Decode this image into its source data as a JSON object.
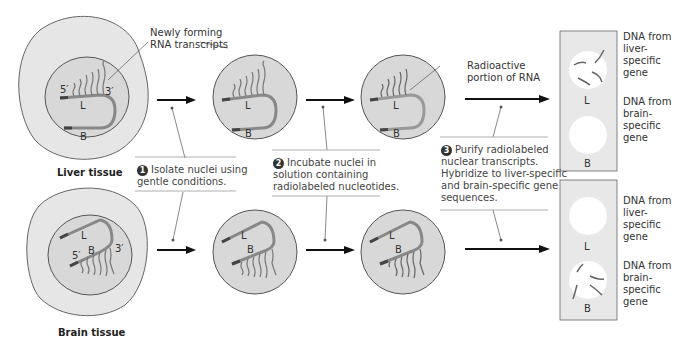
{
  "labels": {
    "newly_forming": "Newly forming RNA transcripts",
    "newly_forming_l1": "Newly forming",
    "newly_forming_l2": "RNA transcripts",
    "radioactive_l1": "Radioactive",
    "radioactive_l2": "portion of RNA",
    "liver_tissue": "Liver tissue",
    "brain_tissue": "Brain tissue",
    "five_prime": "5′",
    "three_prime": "3′",
    "L": "L",
    "B": "B"
  },
  "steps": [
    {
      "num": "1",
      "lines": [
        "Isolate nuclei using",
        "gentle conditions."
      ]
    },
    {
      "num": "2",
      "lines": [
        "Incubate nuclei in",
        "solution containing",
        "radiolabeled nucleotides."
      ]
    },
    {
      "num": "3",
      "lines": [
        "Purify radiolabeled",
        "nuclear transcripts.",
        "Hybridize to liver-specific",
        "and brain-specific gene",
        "sequences."
      ]
    }
  ],
  "dna_labels": {
    "liver": [
      "DNA from",
      "liver-",
      "specific",
      "gene"
    ],
    "brain": [
      "DNA from",
      "brain-",
      "specific",
      "gene"
    ]
  },
  "colors": {
    "cell_fill": "#e6e6e6",
    "nucleus_fill": "#d9d9d9",
    "outline": "#555555",
    "dna": "#7a7a7a",
    "dna_dark": "#444444",
    "filter_fill": "#e8e8e8",
    "spot": "#ffffff"
  }
}
